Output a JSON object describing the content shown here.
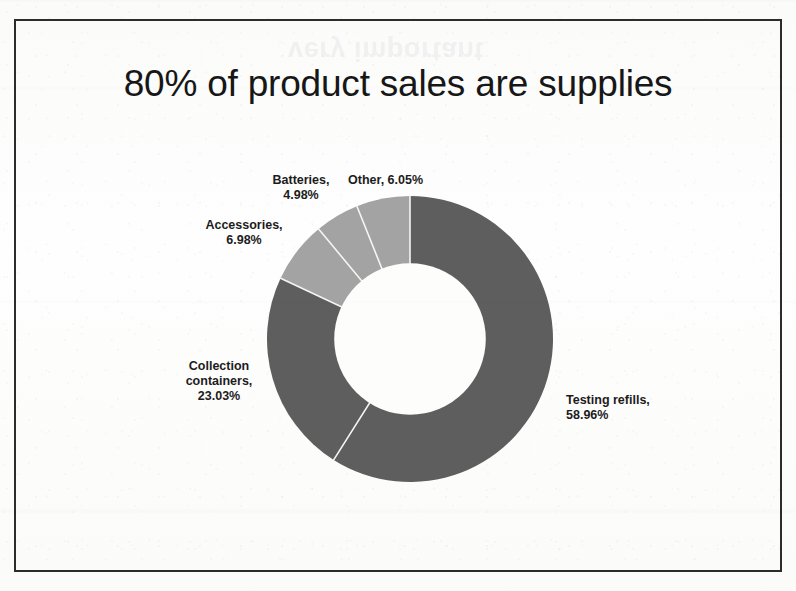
{
  "slide": {
    "title": "80% of product sales are supplies",
    "ghost_text": "very important"
  },
  "colors": {
    "dark_segment": "#5e5e5e",
    "light_segment": "#a3a3a3",
    "frame": "#2c2c2c",
    "text": "#171717",
    "background": "#fdfdfc",
    "separator": "#f2f2f2"
  },
  "labels": {
    "batteries": {
      "line1": "Batteries,",
      "line2": "4.98%"
    },
    "other": {
      "line1": "Other, 6.05%"
    },
    "accessories": {
      "line1": "Accessories,",
      "line2": "6.98%"
    },
    "collection": {
      "line1": "Collection",
      "line2": "containers,",
      "line3": "23.03%"
    },
    "testing": {
      "line1": "Testing refills,",
      "line2": "58.96%"
    }
  },
  "chart_data": {
    "type": "pie",
    "variant": "donut",
    "title": "80% of product sales are supplies",
    "start_angle": 0,
    "direction": "clockwise",
    "hole_ratio": 0.53,
    "legend": "none",
    "labels_position": "outside",
    "categories": [
      "Testing refills",
      "Collection containers",
      "Accessories",
      "Batteries",
      "Other"
    ],
    "values": [
      58.96,
      23.03,
      6.98,
      4.98,
      6.05
    ],
    "unit": "%",
    "value_labels": [
      "58.96%",
      "23.03%",
      "6.98%",
      "4.98%",
      "6.05%"
    ],
    "slice_colors": [
      "#5e5e5e",
      "#5e5e5e",
      "#a3a3a3",
      "#a3a3a3",
      "#a3a3a3"
    ],
    "series": [
      {
        "name": "Product sales share",
        "values": [
          58.96,
          23.03,
          6.98,
          4.98,
          6.05
        ]
      }
    ]
  }
}
